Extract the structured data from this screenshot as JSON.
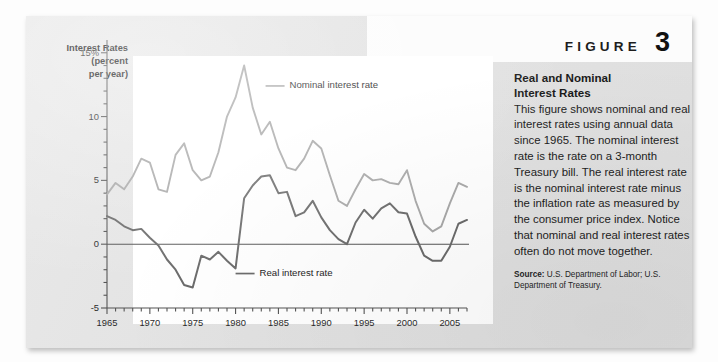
{
  "figure": {
    "word": "FIGURE",
    "number": "3",
    "title_line1": "Real and Nominal",
    "title_line2": "Interest Rates",
    "body": "This figure shows nominal and real interest rates using annual data since 1965. The nominal interest rate is the rate on a 3-month Treasury bill. The real interest rate is the nominal interest rate minus the inflation rate as measured by the consumer price index. Notice that nominal and real interest rates often do not move together.",
    "source_label": "Source:",
    "source_text": " U.S. Department of Labor; U.S. Department of Treasury."
  },
  "colors": {
    "panel_background": "#e4e4e4",
    "plot_background": "#ffffff",
    "nominal_line": "#a8a8a8",
    "real_line": "#6b6b6b",
    "axis": "#555555",
    "zero_line": "#555555",
    "text": "#1b1b1b"
  },
  "chart_data": {
    "type": "line",
    "title": "Real and Nominal Interest Rates",
    "xlabel": "",
    "ylabel": "Interest Rates (percent per year)",
    "ylabel_lines": [
      "Interest Rates",
      "(percent",
      "per year)"
    ],
    "ylim": [
      -5,
      16
    ],
    "xlim": [
      1965,
      2007
    ],
    "yticks": [
      -5,
      0,
      5,
      10,
      15
    ],
    "ytick_labels": [
      "-5",
      "0",
      "5",
      "10",
      "15%"
    ],
    "ytick_minor_step": 1,
    "xticks": [
      1965,
      1970,
      1975,
      1980,
      1985,
      1990,
      1995,
      2000,
      2005
    ],
    "xtick_labels": [
      "1965",
      "1970",
      "1975",
      "1980",
      "1985",
      "1990",
      "1995",
      "2000",
      "2005"
    ],
    "xtick_minor_step": 1,
    "grid": false,
    "zero_line": 0,
    "legend_position": "in-plot-annotations",
    "annotations": [
      {
        "text": "Nominal interest rate",
        "series": "Nominal interest rate",
        "x": 1983.5,
        "y": 12.4
      },
      {
        "text": "Real interest rate",
        "series": "Real interest rate",
        "x": 1980.0,
        "y": -2.3
      }
    ],
    "x": [
      1965,
      1966,
      1967,
      1968,
      1969,
      1970,
      1971,
      1972,
      1973,
      1974,
      1975,
      1976,
      1977,
      1978,
      1979,
      1980,
      1981,
      1982,
      1983,
      1984,
      1985,
      1986,
      1987,
      1988,
      1989,
      1990,
      1991,
      1992,
      1993,
      1994,
      1995,
      1996,
      1997,
      1998,
      1999,
      2000,
      2001,
      2002,
      2003,
      2004,
      2005,
      2006,
      2007
    ],
    "series": [
      {
        "name": "Nominal interest rate",
        "color": "#a8a8a8",
        "values": [
          3.9,
          4.8,
          4.3,
          5.3,
          6.7,
          6.4,
          4.3,
          4.1,
          7.0,
          7.9,
          5.8,
          5.0,
          5.3,
          7.2,
          10.0,
          11.5,
          14.0,
          10.7,
          8.6,
          9.6,
          7.5,
          6.0,
          5.8,
          6.7,
          8.1,
          7.5,
          5.4,
          3.4,
          3.0,
          4.3,
          5.5,
          5.0,
          5.1,
          4.8,
          4.7,
          5.8,
          3.4,
          1.6,
          1.0,
          1.4,
          3.2,
          4.8,
          4.5
        ]
      },
      {
        "name": "Real interest rate",
        "color": "#6b6b6b",
        "values": [
          2.2,
          1.9,
          1.4,
          1.1,
          1.2,
          0.5,
          -0.1,
          -1.2,
          -2.0,
          -3.2,
          -3.4,
          -0.9,
          -1.2,
          -0.6,
          -1.3,
          -1.9,
          3.6,
          4.6,
          5.3,
          5.4,
          4.0,
          4.1,
          2.2,
          2.5,
          3.4,
          2.1,
          1.1,
          0.4,
          0.0,
          1.7,
          2.7,
          2.0,
          2.8,
          3.2,
          2.5,
          2.4,
          0.6,
          -0.9,
          -1.3,
          -1.3,
          -0.2,
          1.6,
          1.9
        ]
      }
    ]
  }
}
